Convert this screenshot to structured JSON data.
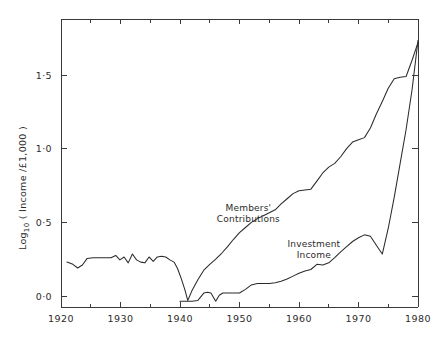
{
  "chart_data": {
    "type": "line",
    "title": "",
    "xlabel": "",
    "ylabel": "Log",
    "ylabel_sub": "10",
    "ylabel_rest": "( Income /£1,000 )",
    "xlim": [
      1920,
      1980
    ],
    "ylim": [
      -0.06,
      1.78
    ],
    "grid": false,
    "legend_position": "inline-annotations",
    "xticks": [
      1920,
      1930,
      1940,
      1950,
      1960,
      1970,
      1980
    ],
    "xtick_labels": [
      "1920",
      "1930",
      "1940",
      "1950",
      "1960",
      "1970",
      "1980"
    ],
    "xminor_ticks": [
      1925,
      1935,
      1945,
      1955,
      1965,
      1975
    ],
    "yticks": [
      0.0,
      0.5,
      1.0,
      1.5
    ],
    "ytick_labels": [
      "0·0",
      "0·5",
      "1·0",
      "1·5"
    ],
    "annotations": [
      {
        "text_line1": "Members'",
        "text_line2": "Contributions",
        "x": 1951.5,
        "y": 0.58
      },
      {
        "text_line1": "Investment",
        "text_line2": "Income",
        "x": 1962.5,
        "y": 0.33
      }
    ],
    "series": [
      {
        "name": "Members' Contributions",
        "x": [
          1921.0,
          1922.0,
          1922.8,
          1923.6,
          1924.4,
          1925.4,
          1926.4,
          1927.4,
          1928.4,
          1929.2,
          1929.9,
          1930.6,
          1931.3,
          1932.0,
          1932.7,
          1933.4,
          1934.1,
          1934.8,
          1935.5,
          1936.2,
          1936.9,
          1937.6,
          1938.3,
          1939.0,
          1939.6,
          1940.2,
          1940.8,
          1941.3,
          1942.0,
          1943.0,
          1944.0,
          1945.0,
          1946.0,
          1947.0,
          1948.0,
          1949.0,
          1950.0,
          1951.0,
          1952.0,
          1953.0,
          1954.0,
          1955.0,
          1956.0,
          1957.0,
          1958.0,
          1959.0,
          1960.0,
          1961.0,
          1962.0,
          1963.0,
          1964.0,
          1965.0,
          1966.0,
          1967.0,
          1968.0,
          1969.0,
          1970.0,
          1971.0,
          1972.0,
          1973.0,
          1974.0,
          1975.0,
          1976.0,
          1977.0,
          1978.0,
          1979.0,
          1980.0
        ],
        "y": [
          0.23,
          0.215,
          0.19,
          0.21,
          0.255,
          0.26,
          0.26,
          0.26,
          0.26,
          0.275,
          0.245,
          0.265,
          0.225,
          0.285,
          0.245,
          0.23,
          0.225,
          0.265,
          0.235,
          0.265,
          0.27,
          0.265,
          0.245,
          0.23,
          0.185,
          0.12,
          0.045,
          -0.03,
          0.035,
          0.11,
          0.175,
          0.215,
          0.25,
          0.29,
          0.335,
          0.385,
          0.43,
          0.465,
          0.5,
          0.525,
          0.545,
          0.565,
          0.585,
          0.625,
          0.66,
          0.695,
          0.715,
          0.72,
          0.725,
          0.78,
          0.835,
          0.875,
          0.9,
          0.945,
          1.0,
          1.045,
          1.06,
          1.075,
          1.14,
          1.235,
          1.32,
          1.41,
          1.475,
          1.485,
          1.49,
          1.6,
          1.72
        ]
      },
      {
        "name": "Investment Income",
        "x": [
          1940.0,
          1941.0,
          1942.0,
          1943.0,
          1944.0,
          1944.6,
          1945.2,
          1946.0,
          1946.6,
          1947.2,
          1948.0,
          1949.0,
          1950.0,
          1951.0,
          1952.0,
          1953.0,
          1954.0,
          1955.0,
          1956.0,
          1957.0,
          1958.0,
          1959.0,
          1960.0,
          1961.0,
          1962.0,
          1963.0,
          1964.0,
          1965.0,
          1966.0,
          1967.0,
          1968.0,
          1969.0,
          1970.0,
          1971.0,
          1972.0,
          1973.0,
          1974.0,
          1975.0,
          1976.0,
          1977.0,
          1978.0,
          1979.0,
          1980.0
        ],
        "y": [
          -0.035,
          -0.035,
          -0.035,
          -0.03,
          0.02,
          0.025,
          0.02,
          -0.035,
          0.005,
          0.02,
          0.02,
          0.02,
          0.02,
          0.045,
          0.075,
          0.085,
          0.085,
          0.085,
          0.09,
          0.1,
          0.115,
          0.135,
          0.155,
          0.17,
          0.18,
          0.215,
          0.21,
          0.225,
          0.26,
          0.3,
          0.335,
          0.37,
          0.395,
          0.415,
          0.405,
          0.345,
          0.285,
          0.46,
          0.67,
          0.9,
          1.13,
          1.4,
          1.735
        ]
      }
    ]
  },
  "figure": {
    "background_color": "#ffffff",
    "line_color": "#2b2b2b",
    "axis_color": "#3a3a3a"
  }
}
